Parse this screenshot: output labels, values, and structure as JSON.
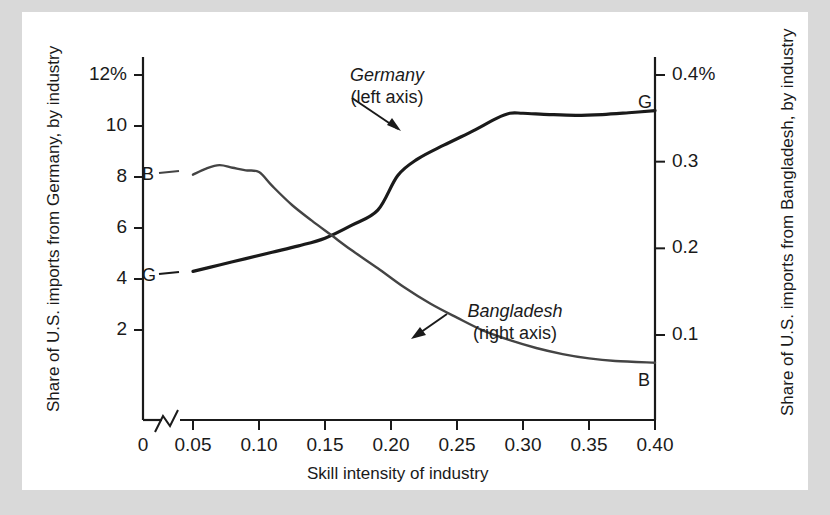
{
  "figure": {
    "background_color": "#d9d9d9",
    "card_color": "#ffffff",
    "line_color": "#1a1a1a"
  },
  "chart_data": {
    "type": "line",
    "title": "",
    "xlabel": "Skill intensity of industry",
    "ylabel_left": "Share of U.S. imports from Germany, by industry",
    "ylabel_right": "Share of U.S. imports from Bangladesh, by industry",
    "x_ticks": [
      "0",
      "0.05",
      "0.10",
      "0.15",
      "0.20",
      "0.25",
      "0.30",
      "0.35",
      "0.40"
    ],
    "x_tick_values": [
      0,
      0.05,
      0.1,
      0.15,
      0.2,
      0.25,
      0.3,
      0.35,
      0.4
    ],
    "xlim": [
      0.05,
      0.4
    ],
    "axis_break": true,
    "y_ticks_left": [
      "12%",
      "10",
      "8",
      "6",
      "4",
      "2"
    ],
    "y_tick_values_left": [
      12,
      10,
      8,
      6,
      4,
      2
    ],
    "ylim_left": [
      0.4,
      12.0
    ],
    "y_ticks_right": [
      "0.4%",
      "0.3",
      "0.2",
      "0.1"
    ],
    "y_tick_values_right": [
      0.4,
      0.3,
      0.2,
      0.1
    ],
    "ylim_right": [
      0.013,
      0.4
    ],
    "grid": false,
    "legend_position": "inline-annotations",
    "series": [
      {
        "name": "Germany",
        "axis": "left",
        "annotation": "Germany",
        "annotation_sub": "(left axis)",
        "endpoint_label_start": "G",
        "endpoint_label_end": "G",
        "x": [
          0.05,
          0.07,
          0.09,
          0.11,
          0.13,
          0.15,
          0.17,
          0.19,
          0.205,
          0.22,
          0.24,
          0.26,
          0.28,
          0.29,
          0.3,
          0.32,
          0.34,
          0.36,
          0.38,
          0.4
        ],
        "values": [
          4.3,
          4.55,
          4.8,
          5.05,
          5.3,
          5.6,
          6.1,
          6.7,
          8.05,
          8.7,
          9.25,
          9.75,
          10.3,
          10.5,
          10.5,
          10.45,
          10.42,
          10.45,
          10.52,
          10.6
        ]
      },
      {
        "name": "Bangladesh",
        "axis": "right",
        "annotation": "Bangladesh",
        "annotation_sub": "(right axis)",
        "endpoint_label_start": "B",
        "endpoint_label_end": "B",
        "x": [
          0.05,
          0.06,
          0.07,
          0.08,
          0.09,
          0.1,
          0.11,
          0.125,
          0.14,
          0.155,
          0.17,
          0.19,
          0.21,
          0.23,
          0.25,
          0.27,
          0.29,
          0.31,
          0.33,
          0.35,
          0.37,
          0.4
        ],
        "values": [
          0.285,
          0.292,
          0.296,
          0.293,
          0.29,
          0.288,
          0.272,
          0.25,
          0.232,
          0.215,
          0.198,
          0.177,
          0.155,
          0.136,
          0.12,
          0.105,
          0.094,
          0.085,
          0.078,
          0.073,
          0.07,
          0.068
        ]
      }
    ]
  },
  "annotations": {
    "germany": {
      "name": "Germany",
      "sub": "(left axis)"
    },
    "bangladesh": {
      "name": "Bangladesh",
      "sub": "(right axis)"
    }
  },
  "point_labels": {
    "germany_start": "G",
    "germany_end": "G",
    "bangladesh_start": "B",
    "bangladesh_end": "B"
  }
}
